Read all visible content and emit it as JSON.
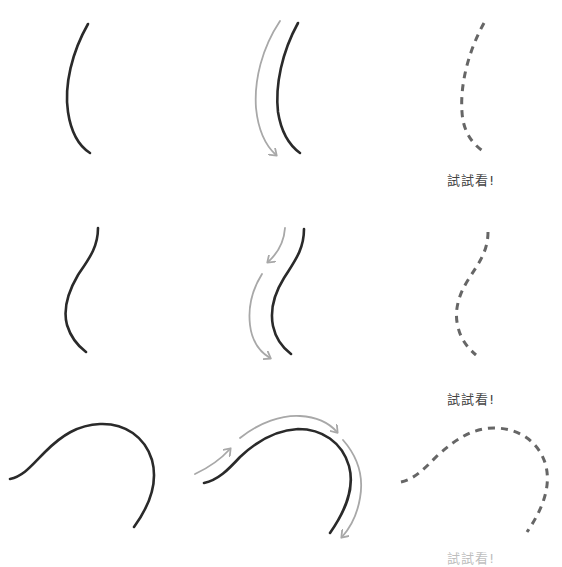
{
  "colors": {
    "solid": "#2a2a2a",
    "arrow": "#a8a8a8",
    "dashed": "#666666",
    "label": "#444444"
  },
  "rows": [
    {
      "name": "row-1-c-curve",
      "columns": [
        "example-stroke",
        "stroke-direction",
        "trace-practice"
      ],
      "label": "試試看!"
    },
    {
      "name": "row-2-s-curve",
      "columns": [
        "example-stroke",
        "stroke-direction",
        "trace-practice"
      ],
      "label": "試試看!"
    },
    {
      "name": "row-3-arc-curve",
      "columns": [
        "example-stroke",
        "stroke-direction",
        "trace-practice"
      ],
      "label": "試試看!"
    }
  ]
}
